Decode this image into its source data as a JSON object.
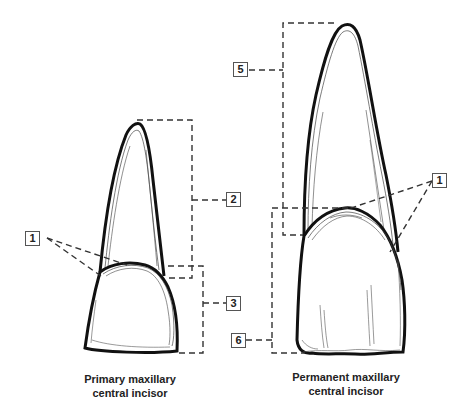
{
  "diagram": {
    "type": "dental anatomy comparison",
    "colors": {
      "outline": "#111111",
      "leader": "#333333",
      "background": "#ffffff"
    },
    "labels": [
      {
        "id": "label-1-left",
        "text": "1"
      },
      {
        "id": "label-2",
        "text": "2"
      },
      {
        "id": "label-3",
        "text": "3"
      },
      {
        "id": "label-1-right",
        "text": "1"
      },
      {
        "id": "label-5",
        "text": "5"
      },
      {
        "id": "label-6",
        "text": "6"
      }
    ],
    "captions": {
      "primary": {
        "line1": "Primary maxillary",
        "line2": "central incisor"
      },
      "permanent": {
        "line1": "Permanent maxillary",
        "line2": "central incisor"
      }
    }
  }
}
